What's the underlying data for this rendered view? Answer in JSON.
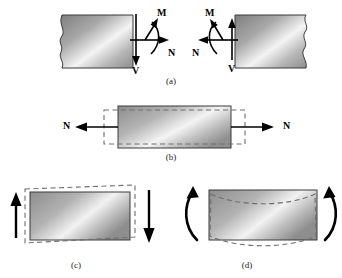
{
  "figure": {
    "background": "#ffffff",
    "ink": "#000000",
    "block_fill_dark": "#8a8a8a",
    "block_fill_light": "#f2f2f2",
    "dashed_color": "#6e6e6e",
    "outline_color": "#3a3a3a"
  },
  "panels": [
    {
      "id": "a",
      "caption": "(a)",
      "description": "Internal resultants exposed on cut faces of a member",
      "left_segment": {
        "name": "left-block",
        "break_edge": "left",
        "labels": [
          {
            "symbol": "M",
            "position": "top",
            "arrow": "curved-up-right"
          },
          {
            "symbol": "N",
            "position": "right",
            "arrow": "straight-right"
          },
          {
            "symbol": "V",
            "position": "bottom",
            "arrow": "straight-down"
          }
        ]
      },
      "right_segment": {
        "name": "right-block",
        "break_edge": "right",
        "labels": [
          {
            "symbol": "M",
            "position": "top",
            "arrow": "curved-up-left"
          },
          {
            "symbol": "N",
            "position": "left",
            "arrow": "straight-left"
          },
          {
            "symbol": "V",
            "position": "bottom",
            "arrow": "straight-down"
          }
        ]
      }
    },
    {
      "id": "b",
      "caption": "(b)",
      "description": "Axial force N elongates the element and contracts it laterally",
      "labels": [
        {
          "symbol": "N",
          "position": "left",
          "arrow": "straight-left"
        },
        {
          "symbol": "N",
          "position": "right",
          "arrow": "straight-right"
        }
      ],
      "deformation": "elongation-with-lateral-contraction"
    },
    {
      "id": "c",
      "caption": "(c)",
      "description": "Shear force V skews the element into a parallelogram",
      "labels": [
        {
          "symbol": "V",
          "position": "top-left",
          "arrow": "straight-up"
        },
        {
          "symbol": "V",
          "position": "bottom-right",
          "arrow": "straight-down"
        }
      ],
      "deformation": "shear-skew"
    },
    {
      "id": "d",
      "caption": "(d)",
      "description": "Bending moment M curves the element",
      "labels": [
        {
          "symbol": "M",
          "position": "top-left",
          "arrow": "curved-counterclockwise"
        },
        {
          "symbol": "M",
          "position": "top-right",
          "arrow": "curved-clockwise"
        }
      ],
      "deformation": "bending-curvature"
    }
  ],
  "symbols": {
    "M": "M",
    "N": "N",
    "V": "V",
    "caption_a": "(a)",
    "caption_b": "(b)",
    "caption_c": "(c)",
    "caption_d": "(d)"
  }
}
